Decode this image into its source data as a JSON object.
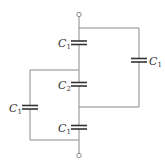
{
  "diagram": {
    "type": "capacitor-circuit",
    "colors": {
      "wire": "#8a8a8a",
      "plate": "#333333",
      "label": "#333333"
    },
    "capacitors": [
      {
        "id": "series-top",
        "label": "C",
        "sub": "1"
      },
      {
        "id": "series-middle",
        "label": "C",
        "sub": "2"
      },
      {
        "id": "series-bottom",
        "label": "C",
        "sub": "1"
      },
      {
        "id": "parallel-right",
        "label": "C",
        "sub": "1"
      },
      {
        "id": "parallel-left",
        "label": "C",
        "sub": "1"
      }
    ],
    "terminals": [
      {
        "id": "top-terminal"
      },
      {
        "id": "bottom-terminal"
      }
    ]
  }
}
